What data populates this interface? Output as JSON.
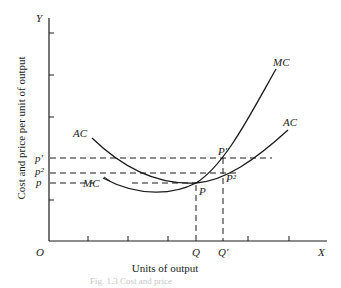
{
  "diagram": {
    "axes": {
      "y_axis_letter": "Y",
      "x_axis_letter": "X",
      "origin": "O",
      "y_label": "Cost and price per unit of output",
      "x_label": "Units of output"
    },
    "curves": {
      "ac_left_label": "AC",
      "ac_right_label": "AC",
      "mc_top_label": "MC",
      "mc_left_label": "MC"
    },
    "price_levels": {
      "p_prime": "p′",
      "p_two": "p²",
      "p": "p"
    },
    "points": {
      "P": "P",
      "P_prime": "P′",
      "P_two": "P²"
    },
    "quantities": {
      "Q": "Q",
      "Q_prime": "Q′"
    },
    "caption": "Fig. 1.3 Cost and price"
  }
}
